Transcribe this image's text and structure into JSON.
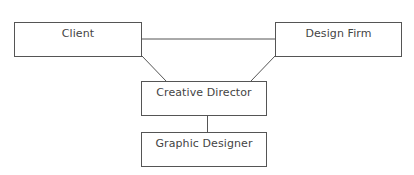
{
  "diagram": {
    "type": "org-chart",
    "nodes": [
      {
        "id": "client",
        "label": "Client"
      },
      {
        "id": "design_firm",
        "label": "Design Firm"
      },
      {
        "id": "creative_director",
        "label": "Creative Director"
      },
      {
        "id": "graphic_designer",
        "label": "Graphic Designer"
      }
    ],
    "edges": [
      {
        "from": "client",
        "to": "design_firm"
      },
      {
        "from": "client",
        "to": "creative_director"
      },
      {
        "from": "design_firm",
        "to": "creative_director"
      },
      {
        "from": "creative_director",
        "to": "graphic_designer"
      }
    ],
    "colors": {
      "line": "#555555",
      "text": "#444444",
      "background": "#ffffff"
    }
  }
}
